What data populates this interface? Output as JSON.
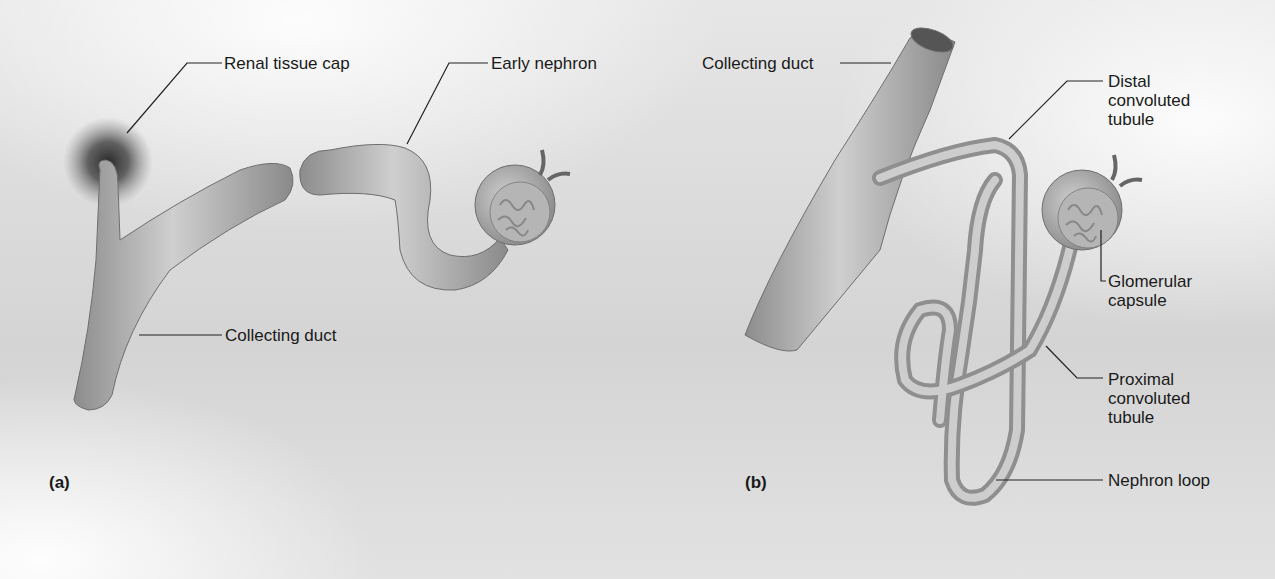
{
  "panels": [
    {
      "id": "a",
      "letter": "(a)",
      "labels": {
        "renal_tissue_cap": "Renal tissue cap",
        "early_nephron": "Early nephron",
        "collecting_duct": "Collecting duct"
      }
    },
    {
      "id": "b",
      "letter": "(b)",
      "labels": {
        "collecting_duct": "Collecting duct",
        "distal_convoluted_tubule": [
          "Distal",
          "convoluted",
          "tubule"
        ],
        "glomerular_capsule": [
          "Glomerular",
          "capsule"
        ],
        "proximal_convoluted_tubule": [
          "Proximal",
          "convoluted",
          "tubule"
        ],
        "nephron_loop": "Nephron loop"
      }
    }
  ],
  "colors": {
    "tube_fill": "#a9a9a9",
    "tube_edge": "#6e6e6e",
    "leader_line": "#222222",
    "text": "#1a1a1a"
  }
}
